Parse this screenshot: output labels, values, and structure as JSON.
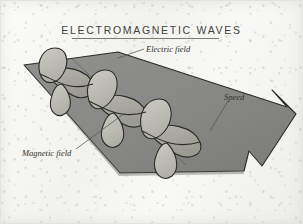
{
  "figure": {
    "title": "ELECTROMAGNETIC WAVES",
    "kind": "physics-illustration",
    "medium": "textbook diagram on mottled paper"
  },
  "labels": {
    "electric_field": "Electric field",
    "speed": "Speed",
    "magnetic_field": "Magnetic field"
  },
  "colors": {
    "paper": "#f6f6f4",
    "ribbon": "#8a8a88",
    "ribbon_shade": "#7c7c7a",
    "lobe": "#bdbdb6",
    "ink": "#33332f",
    "title_ink": "#43433f",
    "rule": "#7a7a74",
    "outline": "#2b2b28",
    "leader": "#555550"
  },
  "icons": {
    "arrow": "direction-arrow-icon",
    "wave": "sine-wave-icon"
  }
}
